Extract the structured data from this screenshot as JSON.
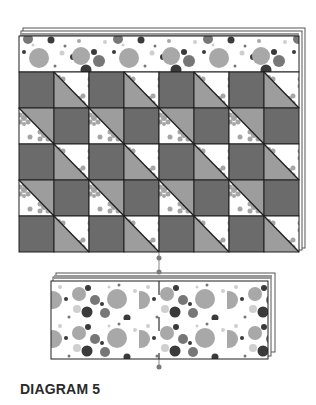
{
  "caption": "DIAGRAM 5",
  "colors": {
    "background": "#ffffff",
    "dark_square": "#6b6b6b",
    "medium_triangle": "#9d9d9d",
    "floral_bg": "#ffffff",
    "floral_motif": "#a6a6a6",
    "outline": "#1e1e1e",
    "dot_dark": "#3a3a3a",
    "dot_mid": "#777777",
    "dot_light": "#a8a8a8",
    "dot_pale": "#cfcfcf",
    "pin": "#7a7a7a"
  },
  "main_quilt": {
    "border_top": {
      "x": 19,
      "y": 36,
      "w": 280,
      "h": 36,
      "fabric": "polka-dot"
    },
    "grid": {
      "x": 19,
      "y": 72,
      "cols": 8,
      "rows": 5,
      "cell_w": 35,
      "cell_h": 36,
      "pattern": [
        [
          "dark",
          "hst-a",
          "dark",
          "hst-a",
          "dark",
          "hst-a",
          "dark",
          "hst-a"
        ],
        [
          "hst-b",
          "dark",
          "hst-b",
          "dark",
          "hst-b",
          "dark",
          "hst-b",
          "dark"
        ],
        [
          "dark",
          "hst-a",
          "dark",
          "hst-a",
          "dark",
          "hst-a",
          "dark",
          "hst-a"
        ],
        [
          "hst-b",
          "dark",
          "hst-b",
          "dark",
          "hst-b",
          "dark",
          "hst-b",
          "dark"
        ],
        [
          "dark",
          "hst-a",
          "dark",
          "hst-a",
          "dark",
          "hst-a",
          "dark",
          "hst-a"
        ]
      ],
      "legend": {
        "dark": "solid dark gray square",
        "hst-a": "half-square triangle: floral top-right, gray bottom-left",
        "hst-b": "half-square triangle: gray top-right, floral bottom-left"
      }
    },
    "back_layers": 2
  },
  "bottom_panel": {
    "x": 51,
    "y": 281,
    "w": 217,
    "h": 78,
    "fabric": "polka-dot",
    "back_layers": 2
  },
  "center_line": {
    "x": 159,
    "pins_y": [
      258,
      272,
      367
    ]
  }
}
